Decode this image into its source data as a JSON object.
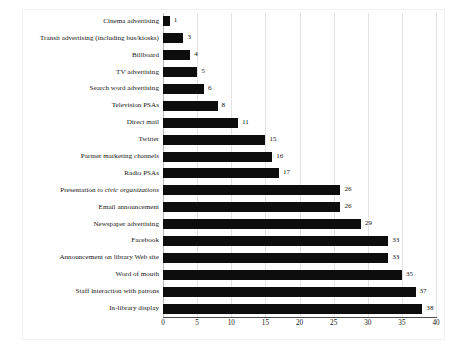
{
  "chart_data": {
    "type": "bar",
    "orientation": "horizontal",
    "title": "",
    "subtitle": "",
    "xlabel": "",
    "ylabel": "",
    "xlim": [
      0,
      40
    ],
    "xticks": [
      "0",
      "5",
      "10",
      "15",
      "20",
      "25",
      "30",
      "35",
      "40"
    ],
    "grid": "vertical",
    "legend": "none",
    "bar_color": "#0d0d0d",
    "gridline_color": "#e3e3e3",
    "categories": [
      "Cinema advertising",
      "Transit advertising (including bus/kiosks)",
      "Billboard",
      "TV advertising",
      "Search word advertising",
      "Television PSAs",
      "Direct mail",
      "Twitter",
      "Partner marketing channels",
      "Radio PSAs",
      "Presentation to civic organizations",
      "Email announcement",
      "Newspaper advertising",
      "Facebook",
      "Announcement on library Web site",
      "Word of mouth",
      "Staff interaction with patrons",
      "In-library display"
    ],
    "values": [
      1,
      3,
      4,
      5,
      6,
      8,
      11,
      15,
      16,
      17,
      26,
      26,
      29,
      33,
      33,
      35,
      37,
      38
    ],
    "value_labels": [
      "1",
      "3",
      "4",
      "5",
      "6",
      "8",
      "11",
      "15",
      "16",
      "17",
      "26",
      "26",
      "29",
      "33",
      "33",
      "35",
      "37",
      "38"
    ],
    "italic_categories": [
      "Presentation to civic organizations"
    ]
  }
}
